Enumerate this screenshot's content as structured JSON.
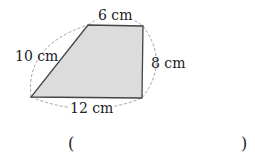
{
  "figure": {
    "shape": "trapezoid",
    "fill_color": "#dcdcdc",
    "stroke_color": "#444444",
    "dashed_color": "#888888",
    "labels": {
      "top": "6 cm",
      "left": "10 cm",
      "right": "8 cm",
      "bottom": "12 cm"
    }
  },
  "answer": {
    "open_paren": "(",
    "close_paren": ")",
    "value": ""
  }
}
